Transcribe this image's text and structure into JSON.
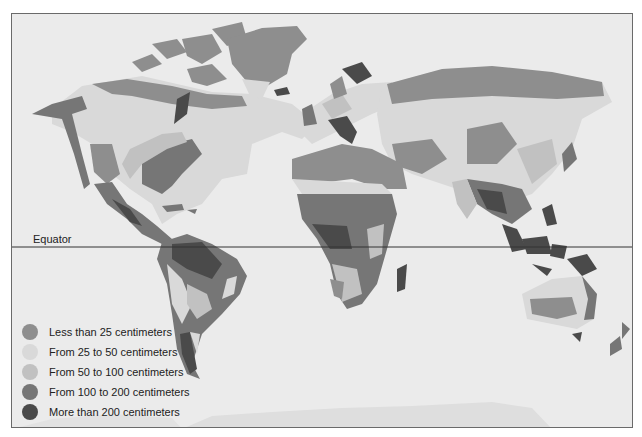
{
  "map": {
    "equator_label": "Equator",
    "legend": [
      {
        "label": "Less than 25 centimeters",
        "color": "#8e8e8e"
      },
      {
        "label": "From 25 to 50 centimeters",
        "color": "#d9d9d9"
      },
      {
        "label": "From 50 to 100 centimeters",
        "color": "#c1c1c1"
      },
      {
        "label": "From 100 to 200 centimeters",
        "color": "#767676"
      },
      {
        "label": "More than 200 centimeters",
        "color": "#4a4a4a"
      }
    ],
    "ocean_color": "#ebebeb"
  }
}
